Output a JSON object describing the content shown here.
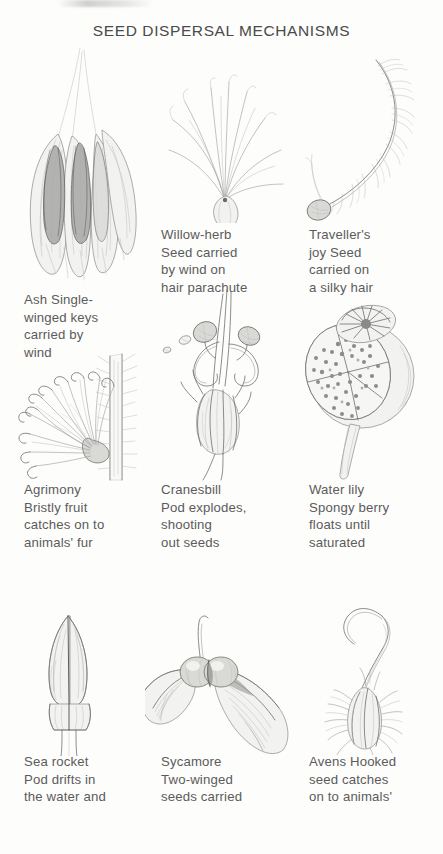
{
  "page": {
    "title": "SEED DISPERSAL MECHANISMS",
    "width": 443,
    "height": 854,
    "background_color": "#fdfdfc",
    "ink_color": "#5b5b5b",
    "medium": "pencil illustration"
  },
  "entries": [
    {
      "id": "ash",
      "row": 1,
      "column": 1,
      "plant": "Ash",
      "mechanism": "wind",
      "illustration_name": "ash-winged-keys-illustration",
      "caption": "Ash Single-\nwinged keys\ncarried by\nwind",
      "caption_lines": [
        "Ash Single-",
        "winged keys",
        "carried by",
        "wind"
      ]
    },
    {
      "id": "willow-herb",
      "row": 1,
      "column": 2,
      "plant": "Willow-herb",
      "mechanism": "wind",
      "illustration_name": "willow-herb-parachute-illustration",
      "caption": "Willow-herb\nSeed carried\nby wind on\nhair parachute",
      "caption_lines": [
        "Willow-herb",
        "Seed carried",
        "by wind on",
        "hair parachute"
      ]
    },
    {
      "id": "travellers-joy",
      "row": 1,
      "column": 3,
      "plant": "Traveller's joy",
      "mechanism": "wind",
      "illustration_name": "travellers-joy-silky-hair-illustration",
      "caption": "Traveller's\njoy Seed\ncarried on\na silky hair",
      "caption_lines": [
        "Traveller's",
        "joy Seed",
        "carried on",
        "a silky hair"
      ]
    },
    {
      "id": "agrimony",
      "row": 2,
      "column": 1,
      "plant": "Agrimony",
      "mechanism": "animal fur",
      "illustration_name": "agrimony-bristly-fruit-illustration",
      "caption": "Agrimony\nBristly fruit\ncatches on to\nanimals' fur",
      "caption_lines": [
        "Agrimony",
        "Bristly fruit",
        "catches on to",
        "animals' fur"
      ]
    },
    {
      "id": "cranesbill",
      "row": 2,
      "column": 2,
      "plant": "Cranesbill",
      "mechanism": "explosive pod",
      "illustration_name": "cranesbill-exploding-pod-illustration",
      "caption": "Cranesbill\nPod explodes,\nshooting\nout seeds",
      "caption_lines": [
        "Cranesbill",
        "Pod explodes,",
        "shooting",
        "out seeds"
      ]
    },
    {
      "id": "water-lily",
      "row": 2,
      "column": 3,
      "plant": "Water lily",
      "mechanism": "water",
      "illustration_name": "water-lily-spongy-berry-illustration",
      "caption": "Water lily\nSpongy berry\nfloats until\nsaturated",
      "caption_lines": [
        "Water lily",
        "Spongy berry",
        "floats until",
        "saturated"
      ]
    },
    {
      "id": "sea-rocket",
      "row": 3,
      "column": 1,
      "plant": "Sea rocket",
      "mechanism": "water",
      "illustration_name": "sea-rocket-pod-illustration",
      "caption": "Sea rocket\nPod drifts in\nthe water and",
      "caption_lines": [
        "Sea rocket",
        "Pod drifts in",
        "the water and"
      ]
    },
    {
      "id": "sycamore",
      "row": 3,
      "column": 2,
      "plant": "Sycamore",
      "mechanism": "wind",
      "illustration_name": "sycamore-two-winged-seeds-illustration",
      "caption": "Sycamore\nTwo-winged\nseeds carried",
      "caption_lines": [
        "Sycamore",
        "Two-winged",
        "seeds carried"
      ]
    },
    {
      "id": "avens",
      "row": 3,
      "column": 3,
      "plant": "Avens",
      "mechanism": "animal fur",
      "illustration_name": "avens-hooked-seed-illustration",
      "caption": "Avens Hooked\nseed catches\non to animals'",
      "caption_lines": [
        "Avens Hooked",
        "seed catches",
        "on to animals'"
      ]
    }
  ]
}
